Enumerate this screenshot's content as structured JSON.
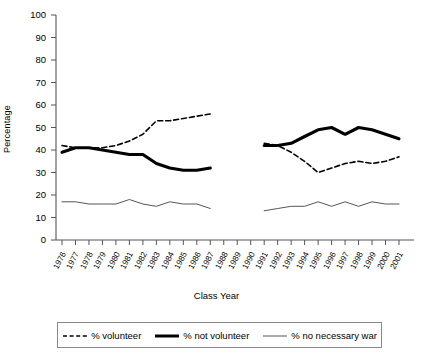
{
  "axes": {
    "ylabel": "Percentage",
    "xlabel": "Class Year",
    "yticks": [
      "0",
      "10",
      "20",
      "30",
      "40",
      "50",
      "60",
      "70",
      "80",
      "90",
      "100"
    ],
    "xticks": [
      "1976",
      "1977",
      "1978",
      "1979",
      "1980",
      "1981",
      "1982",
      "1983",
      "1984",
      "1985",
      "1986",
      "1987",
      "1988",
      "1989",
      "1990",
      "1991",
      "1992",
      "1993",
      "1994",
      "1995",
      "1996",
      "1997",
      "1998",
      "1999",
      "2000",
      "2001"
    ]
  },
  "legend": {
    "items": [
      {
        "label": "% volunteer",
        "style": "dashed",
        "color": "#000000"
      },
      {
        "label": "% not volunteer",
        "style": "thick-solid",
        "color": "#000000"
      },
      {
        "label": "% no necessary war",
        "style": "thin-solid",
        "color": "#555555"
      }
    ]
  },
  "chart_data": {
    "type": "line",
    "title": "",
    "xlabel": "Class Year",
    "ylabel": "Percentage",
    "ylim": [
      0,
      100
    ],
    "xlim": [
      1976,
      2001
    ],
    "grid": false,
    "legend_position": "bottom",
    "note": "Data gap for class years 1988-1990; all three series are missing in that span.",
    "x": [
      1976,
      1977,
      1978,
      1979,
      1980,
      1981,
      1982,
      1983,
      1984,
      1985,
      1986,
      1987,
      1988,
      1989,
      1990,
      1991,
      1992,
      1993,
      1994,
      1995,
      1996,
      1997,
      1998,
      1999,
      2000,
      2001
    ],
    "series": [
      {
        "name": "% volunteer",
        "style": "dashed",
        "values": [
          42,
          41,
          41,
          41,
          42,
          44,
          47,
          53,
          53,
          54,
          55,
          56,
          null,
          null,
          null,
          43,
          42,
          39,
          35,
          30,
          32,
          34,
          35,
          34,
          35,
          37
        ]
      },
      {
        "name": "% not volunteer",
        "style": "thick-solid",
        "values": [
          39,
          41,
          41,
          40,
          39,
          38,
          38,
          34,
          32,
          31,
          31,
          32,
          null,
          null,
          null,
          42,
          42,
          43,
          46,
          49,
          50,
          47,
          50,
          49,
          47,
          45
        ]
      },
      {
        "name": "% no necessary war",
        "style": "thin-solid",
        "values": [
          17,
          17,
          16,
          16,
          16,
          18,
          16,
          15,
          17,
          16,
          16,
          14,
          null,
          null,
          null,
          13,
          14,
          15,
          15,
          17,
          15,
          17,
          15,
          17,
          16,
          16
        ]
      }
    ]
  }
}
